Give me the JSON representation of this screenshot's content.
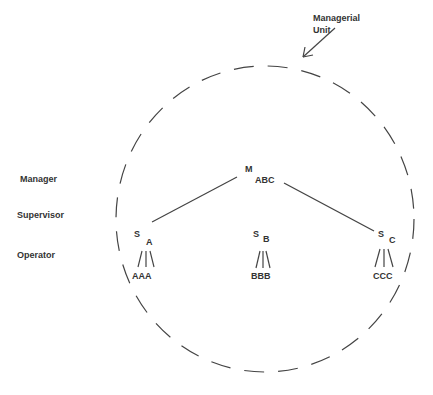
{
  "diagram": {
    "annotation": {
      "line1": "Managerial",
      "line2": "Unit"
    },
    "levels": [
      {
        "label": "Manager"
      },
      {
        "label": "Supervisor"
      },
      {
        "label": "Operator"
      }
    ],
    "manager": {
      "main": "M",
      "sub": "ABC"
    },
    "supervisors": [
      {
        "main": "S",
        "sub": "A",
        "operators": "AAA",
        "connected": true
      },
      {
        "main": "S",
        "sub": "B",
        "operators": "BBB",
        "connected": false
      },
      {
        "main": "S",
        "sub": "C",
        "operators": "CCC",
        "connected": true
      }
    ],
    "colors": {
      "line": "#444444",
      "text": "#333333",
      "background": "#ffffff"
    }
  }
}
